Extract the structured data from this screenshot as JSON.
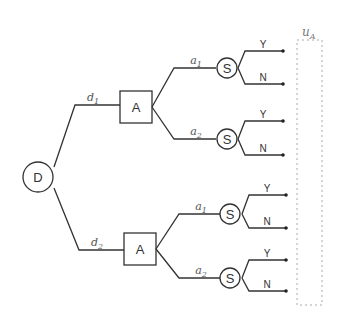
{
  "diagram": {
    "type": "decision-tree",
    "root": {
      "label": "D",
      "shape": "circle"
    },
    "decision_edges": [
      {
        "label": "d",
        "sub": "1"
      },
      {
        "label": "d",
        "sub": "2"
      }
    ],
    "action_nodes": [
      {
        "label": "A",
        "shape": "box"
      },
      {
        "label": "A",
        "shape": "box"
      }
    ],
    "action_edges": [
      {
        "label": "a",
        "sub": "1"
      },
      {
        "label": "a",
        "sub": "2"
      },
      {
        "label": "a",
        "sub": "1"
      },
      {
        "label": "a",
        "sub": "2"
      }
    ],
    "state_nodes": [
      {
        "label": "S",
        "shape": "circle"
      },
      {
        "label": "S",
        "shape": "circle"
      },
      {
        "label": "S",
        "shape": "circle"
      },
      {
        "label": "S",
        "shape": "circle"
      }
    ],
    "outcomes": [
      {
        "yes": "Y",
        "no": "N"
      },
      {
        "yes": "Y",
        "no": "N"
      },
      {
        "yes": "Y",
        "no": "N"
      },
      {
        "yes": "Y",
        "no": "N"
      }
    ],
    "utility": {
      "label": "u",
      "sub": "A"
    }
  }
}
